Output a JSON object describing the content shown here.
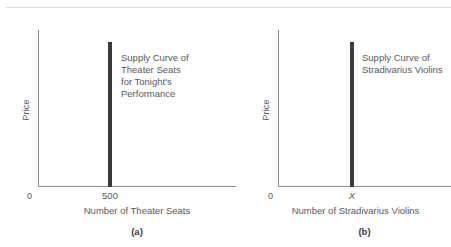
{
  "figure": {
    "background_color": "#ffffff",
    "rule_color": "#d9dadb",
    "axis_color": "#8a8c8e",
    "curve_color": "#3b3b3d",
    "text_color": "#58595b"
  },
  "panels": [
    {
      "letter": "(a)",
      "ylabel": "Price",
      "xlabel": "Number of Theater Seats",
      "origin_label": "0",
      "tick_label": "500",
      "annotation": "Supply Curve of\nTheater Seats\nfor Tonight's\nPerformance"
    },
    {
      "letter": "(b)",
      "ylabel": "Price",
      "xlabel": "Number of Stradivarius Violins",
      "origin_label": "0",
      "tick_label": "X",
      "annotation": "Supply Curve of\nStradivarius Violins"
    }
  ],
  "chart_data": [
    {
      "type": "line",
      "title": "",
      "xlabel": "Number of Theater Seats",
      "ylabel": "Price",
      "series": [
        {
          "name": "Supply Curve of Theater Seats for Tonight's Performance",
          "shape": "vertical-line",
          "x": 500,
          "y_from": 0,
          "y_to": 1
        }
      ],
      "xticks": [
        "0",
        "500"
      ],
      "yticks": [],
      "grid": false,
      "legend": "inline-annotation"
    },
    {
      "type": "line",
      "title": "",
      "xlabel": "Number of Stradivarius Violins",
      "ylabel": "Price",
      "series": [
        {
          "name": "Supply Curve of Stradivarius Violins",
          "shape": "vertical-line",
          "x": "X",
          "y_from": 0,
          "y_to": 1
        }
      ],
      "xticks": [
        "0",
        "X"
      ],
      "yticks": [],
      "grid": false,
      "legend": "inline-annotation"
    }
  ]
}
